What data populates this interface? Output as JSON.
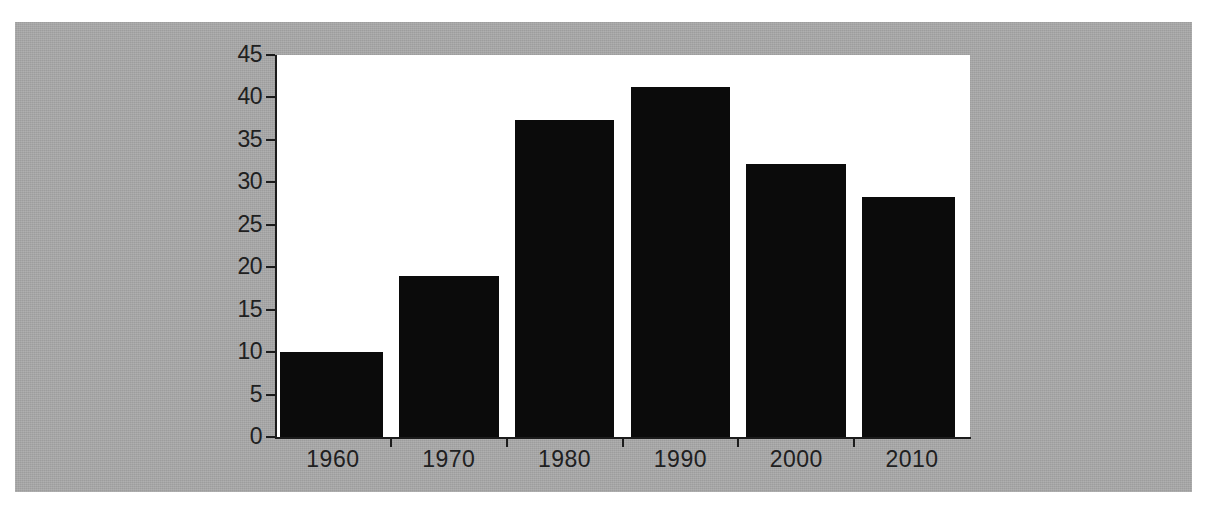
{
  "page": {
    "background_color": "#a8a8a8",
    "plot_background_color": "#ffffff",
    "ink_color": "#1c1c1c"
  },
  "chart_data": {
    "type": "bar",
    "title": "",
    "subtitle": "",
    "xlabel": "",
    "ylabel": "",
    "categories": [
      "1960",
      "1970",
      "1980",
      "1990",
      "2000",
      "2010"
    ],
    "values": [
      10,
      19,
      37.3,
      41.2,
      32.2,
      28.3
    ],
    "series": [
      {
        "name": "",
        "values": [
          10,
          19,
          37.3,
          41.2,
          32.2,
          28.3
        ]
      }
    ],
    "ylim": [
      0,
      45
    ],
    "xlim_categories": 6,
    "y_ticks": [
      0,
      5,
      10,
      15,
      20,
      25,
      30,
      35,
      40,
      45
    ],
    "y_tick_labels": [
      "0",
      "5",
      "10",
      "15",
      "20",
      "25",
      "30",
      "35",
      "40",
      "45"
    ],
    "x_tick_labels": [
      "1960",
      "1970",
      "1980",
      "1990",
      "2000",
      "2010"
    ],
    "grid": false,
    "legend": false,
    "legend_position": "none",
    "bar_color": "#0b0b0b",
    "annotations": []
  }
}
